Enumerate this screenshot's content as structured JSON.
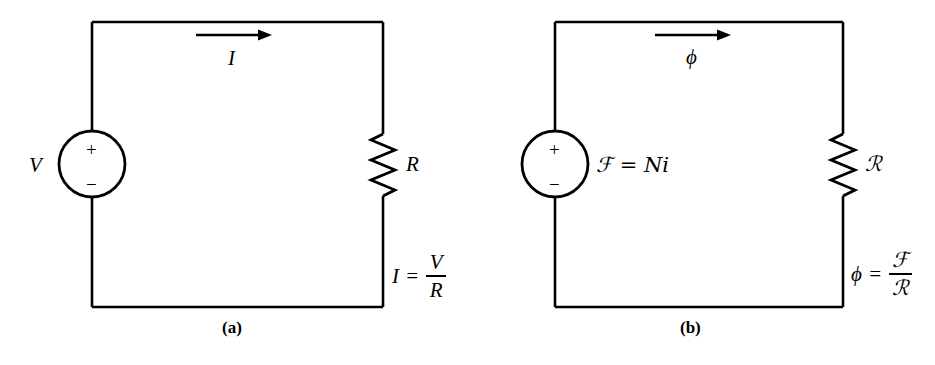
{
  "figure": {
    "background_color": "#ffffff",
    "line_color": "#000000"
  },
  "panels": [
    {
      "id": "a",
      "caption": "(a)",
      "kind": "electric-circuit",
      "source": {
        "name": "voltage-source",
        "label": "V",
        "plus_sign": "+",
        "minus_sign": "−"
      },
      "flow": {
        "name": "current-arrow",
        "label": "I",
        "direction": "right"
      },
      "element": {
        "name": "resistor",
        "label": "R"
      },
      "equation": {
        "lhs": "I",
        "equals": "=",
        "numerator": "V",
        "denominator": "R",
        "full": "I = V/R"
      }
    },
    {
      "id": "b",
      "caption": "(b)",
      "kind": "magnetic-circuit",
      "source": {
        "name": "mmf-source",
        "label": "ℱ = Ni",
        "plus_sign": "+",
        "minus_sign": "−"
      },
      "flow": {
        "name": "flux-arrow",
        "label": "ϕ",
        "direction": "right"
      },
      "element": {
        "name": "reluctance",
        "label": "ℛ"
      },
      "equation": {
        "lhs": "ϕ",
        "equals": "=",
        "numerator": "ℱ",
        "denominator": "ℛ",
        "full": "ϕ = ℱ/ℛ"
      }
    }
  ]
}
